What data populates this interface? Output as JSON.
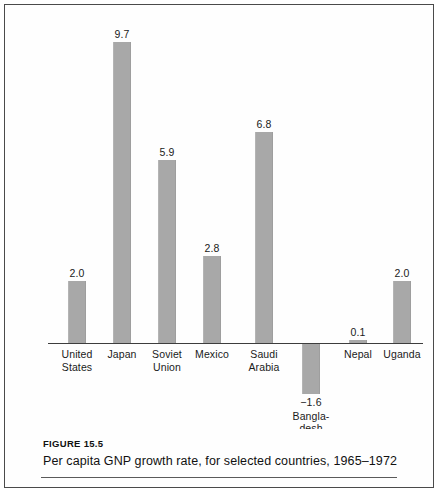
{
  "figure": {
    "label": "FIGURE 15.5",
    "caption": "Per capita GNP growth rate, for selected countries, 1965–1972"
  },
  "chart_data": {
    "type": "bar",
    "xlabel": "",
    "ylabel": "",
    "ylim": [
      -2.0,
      10.0
    ],
    "grid": false,
    "legend": null,
    "axis": {
      "zero_line": true
    },
    "bar_color": "#a8a8a8",
    "categories": [
      "United States",
      "Japan",
      "Soviet Union",
      "Mexico",
      "Saudi Arabia",
      "Bangladesh",
      "Nepal",
      "Uganda"
    ],
    "values": [
      2.0,
      9.7,
      5.9,
      2.8,
      6.8,
      -1.6,
      0.1,
      2.0
    ],
    "data_labels": [
      "2.0",
      "9.7",
      "5.9",
      "2.8",
      "6.8",
      "−1.6",
      "0.1",
      "2.0"
    ],
    "points": [
      {
        "category": "United States",
        "label_lines": [
          "United",
          "States"
        ],
        "value": 2.0,
        "data_label": "2.0"
      },
      {
        "category": "Japan",
        "label_lines": [
          "Japan"
        ],
        "value": 9.7,
        "data_label": "9.7"
      },
      {
        "category": "Soviet Union",
        "label_lines": [
          "Soviet",
          "Union"
        ],
        "value": 5.9,
        "data_label": "5.9"
      },
      {
        "category": "Mexico",
        "label_lines": [
          "Mexico"
        ],
        "value": 2.8,
        "data_label": "2.8"
      },
      {
        "category": "Saudi Arabia",
        "label_lines": [
          "Saudi",
          "Arabia"
        ],
        "value": 6.8,
        "data_label": "6.8"
      },
      {
        "category": "Bangladesh",
        "label_lines": [
          "Bangla-",
          "desh"
        ],
        "value": -1.6,
        "data_label": "−1.6"
      },
      {
        "category": "Nepal",
        "label_lines": [
          "Nepal"
        ],
        "value": 0.1,
        "data_label": "0.1"
      },
      {
        "category": "Uganda",
        "label_lines": [
          "Uganda"
        ],
        "value": 2.0,
        "data_label": "2.0"
      }
    ]
  }
}
